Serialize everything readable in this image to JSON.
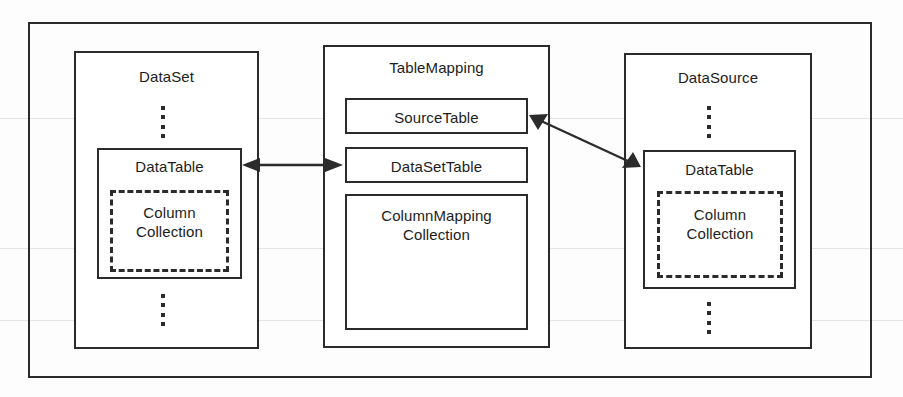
{
  "diagram": {
    "frame": {
      "label": "outer-frame"
    },
    "colors": {
      "line": "#2b2b2b",
      "text": "#1d1d1d",
      "background": "#ffffff"
    },
    "panels": [
      {
        "id": "dataset",
        "label": "DataSet",
        "children": [
          {
            "id": "dataset-datatable",
            "label": "DataTable",
            "style": "solid"
          },
          {
            "id": "dataset-columncollection",
            "label": "Column\nCollection",
            "style": "dashed"
          }
        ],
        "ellipsis": [
          "top",
          "bottom"
        ]
      },
      {
        "id": "tablemapping",
        "label": "TableMapping",
        "children": [
          {
            "id": "sourcetable",
            "label": "SourceTable",
            "style": "solid"
          },
          {
            "id": "datasettable",
            "label": "DataSetTable",
            "style": "solid"
          },
          {
            "id": "columnmapping",
            "label": "ColumnMapping\nCollection",
            "style": "solid"
          }
        ],
        "ellipsis": []
      },
      {
        "id": "datasource",
        "label": "DataSource",
        "children": [
          {
            "id": "datasource-datatable",
            "label": "DataTable",
            "style": "solid"
          },
          {
            "id": "datasource-columncollection",
            "label": "Column\nCollection",
            "style": "dashed"
          }
        ],
        "ellipsis": [
          "top",
          "bottom"
        ]
      }
    ],
    "connectors": [
      {
        "id": "dataset-to-datasettable",
        "from": "dataset-datatable",
        "to": "datasettable",
        "heads": "both",
        "label": ""
      },
      {
        "id": "sourcetable-to-datasource-datatable",
        "from": "sourcetable",
        "to": "datasource-datatable",
        "heads": "both",
        "label": ""
      }
    ]
  }
}
